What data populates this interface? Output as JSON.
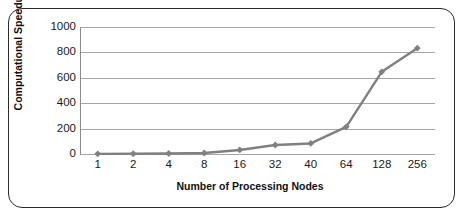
{
  "chart_data": {
    "type": "line",
    "title": "",
    "xlabel": "Number of Processing Nodes",
    "ylabel": "Computational Speedup",
    "categories": [
      "1",
      "2",
      "4",
      "8",
      "16",
      "32",
      "40",
      "64",
      "128",
      "256"
    ],
    "values": [
      1,
      2,
      4,
      8,
      32,
      71,
      83,
      214,
      647,
      833
    ],
    "series": [
      {
        "name": "Computational Speedup",
        "values": [
          1,
          2,
          4,
          8,
          32,
          71,
          83,
          214,
          647,
          833
        ]
      }
    ],
    "ylim": [
      0,
      1000
    ],
    "yticks": [
      "0",
      "200",
      "400",
      "600",
      "800",
      "1000"
    ],
    "ytick_values": [
      0,
      200,
      400,
      600,
      800,
      1000
    ],
    "grid": "horizontal",
    "legend": "none",
    "marker": "diamond",
    "colors": {
      "series": "#808080",
      "gridline": "#a6a6a6",
      "axis": "#8c8c8c",
      "text": "#1a1a1a",
      "frame": "#2b2b2b",
      "background": "#ffffff"
    }
  }
}
